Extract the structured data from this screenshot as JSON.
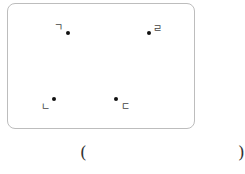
{
  "diagram": {
    "points": [
      {
        "id": "p1",
        "label": "ㄱ"
      },
      {
        "id": "p2",
        "label": "ㄹ"
      },
      {
        "id": "p3",
        "label": "ㄴ"
      },
      {
        "id": "p4",
        "label": "ㄷ"
      }
    ]
  },
  "answer": {
    "open_paren": "(",
    "close_paren": ")",
    "value": ""
  }
}
